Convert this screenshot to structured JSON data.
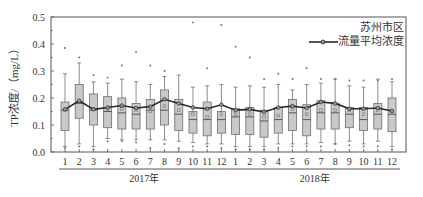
{
  "chart_data": {
    "type": "box",
    "title": "",
    "ylabel": "TP浓度/（mg/L）",
    "xlabel": "",
    "ylim": [
      0,
      0.5
    ],
    "yticks": [
      "0.0",
      "0.1",
      "0.2",
      "0.3",
      "0.4",
      "0.5"
    ],
    "groups": [
      {
        "label": "2017年",
        "categories": [
          "1",
          "2",
          "3",
          "4",
          "5",
          "6",
          "7",
          "8",
          "9",
          "10",
          "11",
          "12"
        ]
      },
      {
        "label": "2018年",
        "categories": [
          "1",
          "2",
          "3",
          "4",
          "5",
          "6",
          "7",
          "8",
          "9",
          "10",
          "11",
          "12"
        ]
      }
    ],
    "legend": {
      "title": "苏州市区",
      "series_label": "流量平均浓度",
      "position": "upper right"
    },
    "colors": {
      "box_fill": "#c9c9c9",
      "box_stroke": "#6e6e6e",
      "line": "#2a2a2a",
      "axis": "#555555"
    },
    "boxes": [
      {
        "group": "2017年",
        "month": 1,
        "q1": 0.08,
        "median": 0.155,
        "q3": 0.185,
        "whisker_low": 0.02,
        "whisker_high": 0.29,
        "mean": 0.155,
        "outliers": [
          0.385,
          0.015
        ]
      },
      {
        "group": "2017年",
        "month": 2,
        "q1": 0.125,
        "median": 0.18,
        "q3": 0.25,
        "whisker_low": 0.03,
        "whisker_high": 0.33,
        "mean": 0.185,
        "outliers": [
          0.35,
          0.02
        ]
      },
      {
        "group": "2017年",
        "month": 3,
        "q1": 0.1,
        "median": 0.155,
        "q3": 0.215,
        "whisker_low": 0.02,
        "whisker_high": 0.26,
        "mean": 0.16,
        "outliers": [
          0.285,
          0.01
        ]
      },
      {
        "group": "2017年",
        "month": 4,
        "q1": 0.09,
        "median": 0.15,
        "q3": 0.205,
        "whisker_low": 0.05,
        "whisker_high": 0.255,
        "mean": 0.16,
        "outliers": [
          0.275,
          0.04
        ]
      },
      {
        "group": "2017年",
        "month": 5,
        "q1": 0.085,
        "median": 0.145,
        "q3": 0.2,
        "whisker_low": 0.045,
        "whisker_high": 0.27,
        "mean": 0.16,
        "outliers": [
          0.32,
          0.04
        ]
      },
      {
        "group": "2017年",
        "month": 6,
        "q1": 0.085,
        "median": 0.14,
        "q3": 0.18,
        "whisker_low": 0.045,
        "whisker_high": 0.26,
        "mean": 0.155,
        "outliers": [
          0.37,
          0.035
        ]
      },
      {
        "group": "2017年",
        "month": 7,
        "q1": 0.085,
        "median": 0.155,
        "q3": 0.195,
        "whisker_low": 0.045,
        "whisker_high": 0.25,
        "mean": 0.15,
        "outliers": [
          0.32,
          0.015
        ]
      },
      {
        "group": "2017年",
        "month": 8,
        "q1": 0.1,
        "median": 0.155,
        "q3": 0.23,
        "whisker_low": 0.045,
        "whisker_high": 0.28,
        "mean": 0.17,
        "outliers": [
          0.3,
          0.03
        ]
      },
      {
        "group": "2017年",
        "month": 9,
        "q1": 0.08,
        "median": 0.14,
        "q3": 0.195,
        "whisker_low": 0.04,
        "whisker_high": 0.285,
        "mean": 0.155,
        "outliers": [
          0.015
        ]
      },
      {
        "group": "2017年",
        "month": 10,
        "q1": 0.07,
        "median": 0.12,
        "q3": 0.15,
        "whisker_low": 0.035,
        "whisker_high": 0.24,
        "mean": 0.14,
        "outliers": [
          0.48,
          0.02
        ]
      },
      {
        "group": "2017年",
        "month": 11,
        "q1": 0.06,
        "median": 0.12,
        "q3": 0.185,
        "whisker_low": 0.03,
        "whisker_high": 0.245,
        "mean": 0.13,
        "outliers": [
          0.31,
          0.02
        ]
      },
      {
        "group": "2017年",
        "month": 12,
        "q1": 0.07,
        "median": 0.12,
        "q3": 0.15,
        "whisker_low": 0.03,
        "whisker_high": 0.25,
        "mean": 0.14,
        "outliers": [
          0.47,
          0.015
        ]
      },
      {
        "group": "2018年",
        "month": 1,
        "q1": 0.065,
        "median": 0.13,
        "q3": 0.16,
        "whisker_low": 0.02,
        "whisker_high": 0.24,
        "mean": 0.14,
        "outliers": [
          0.39,
          0.01
        ]
      },
      {
        "group": "2018年",
        "month": 2,
        "q1": 0.065,
        "median": 0.13,
        "q3": 0.165,
        "whisker_low": 0.02,
        "whisker_high": 0.245,
        "mean": 0.14,
        "outliers": [
          0.35,
          0.01
        ]
      },
      {
        "group": "2018年",
        "month": 3,
        "q1": 0.055,
        "median": 0.115,
        "q3": 0.155,
        "whisker_low": 0.02,
        "whisker_high": 0.24,
        "mean": 0.13,
        "outliers": [
          0.27,
          0.01
        ]
      },
      {
        "group": "2018年",
        "month": 4,
        "q1": 0.07,
        "median": 0.12,
        "q3": 0.165,
        "whisker_low": 0.03,
        "whisker_high": 0.25,
        "mean": 0.135,
        "outliers": [
          0.29,
          0.015
        ]
      },
      {
        "group": "2018年",
        "month": 5,
        "q1": 0.08,
        "median": 0.145,
        "q3": 0.195,
        "whisker_low": 0.03,
        "whisker_high": 0.23,
        "mean": 0.16,
        "outliers": [
          0.27,
          0.02
        ]
      },
      {
        "group": "2018年",
        "month": 6,
        "q1": 0.06,
        "median": 0.12,
        "q3": 0.175,
        "whisker_low": 0.03,
        "whisker_high": 0.25,
        "mean": 0.14,
        "outliers": [
          0.31,
          0.02
        ]
      },
      {
        "group": "2018年",
        "month": 7,
        "q1": 0.085,
        "median": 0.145,
        "q3": 0.19,
        "whisker_low": 0.035,
        "whisker_high": 0.255,
        "mean": 0.155,
        "outliers": [
          0.27,
          0.02
        ]
      },
      {
        "group": "2018年",
        "month": 8,
        "q1": 0.085,
        "median": 0.145,
        "q3": 0.18,
        "whisker_low": 0.03,
        "whisker_high": 0.27,
        "mean": 0.155,
        "outliers": [
          0.27,
          0.03
        ]
      },
      {
        "group": "2018年",
        "month": 9,
        "q1": 0.09,
        "median": 0.14,
        "q3": 0.165,
        "whisker_low": 0.04,
        "whisker_high": 0.245,
        "mean": 0.155,
        "outliers": [
          0.265,
          0.025
        ]
      },
      {
        "group": "2018年",
        "month": 10,
        "q1": 0.08,
        "median": 0.12,
        "q3": 0.165,
        "whisker_low": 0.03,
        "whisker_high": 0.24,
        "mean": 0.14,
        "outliers": [
          0.265,
          0.02
        ]
      },
      {
        "group": "2018年",
        "month": 11,
        "q1": 0.085,
        "median": 0.14,
        "q3": 0.18,
        "whisker_low": 0.04,
        "whisker_high": 0.27,
        "mean": 0.155,
        "outliers": [
          0.265,
          0.02
        ]
      },
      {
        "group": "2018年",
        "month": 12,
        "q1": 0.075,
        "median": 0.14,
        "q3": 0.2,
        "whisker_low": 0.02,
        "whisker_high": 0.26,
        "mean": 0.15,
        "outliers": [
          0.27,
          0.01
        ]
      }
    ],
    "series": [
      {
        "name": "流量平均浓度",
        "type": "line",
        "values": [
          0.158,
          0.19,
          0.158,
          0.165,
          0.172,
          0.163,
          0.168,
          0.195,
          0.18,
          0.165,
          0.16,
          0.175,
          0.155,
          0.158,
          0.148,
          0.165,
          0.17,
          0.163,
          0.185,
          0.18,
          0.16,
          0.16,
          0.163,
          0.152
        ]
      }
    ]
  }
}
